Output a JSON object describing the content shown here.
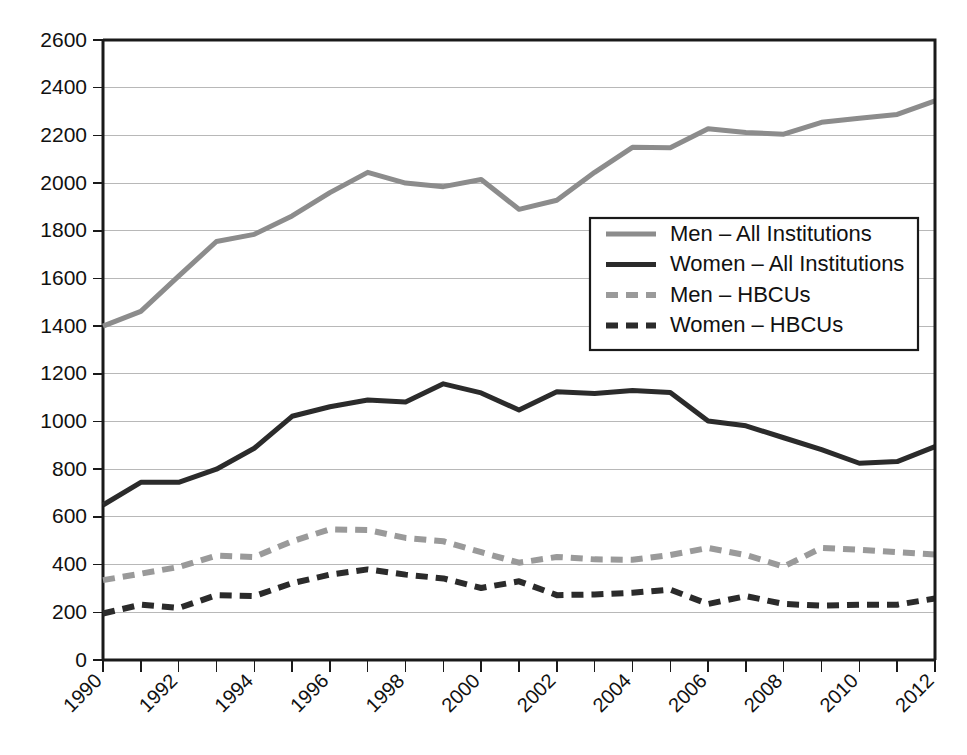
{
  "chart_data": {
    "type": "line",
    "title": "",
    "subtitle": "",
    "xlabel": "",
    "ylabel": "",
    "xlim": [
      1990,
      2012
    ],
    "ylim": [
      0,
      2600
    ],
    "ytick_step": 200,
    "xtick_step": 1,
    "xlabel_step": 2,
    "grid": true,
    "grid_axis": "y",
    "legend_position": "inside-upper-right",
    "x": [
      1990,
      1991,
      1992,
      1993,
      1994,
      1995,
      1996,
      1997,
      1998,
      1999,
      2000,
      2001,
      2002,
      2003,
      2004,
      2005,
      2006,
      2007,
      2008,
      2009,
      2010,
      2011,
      2012
    ],
    "xtick_labels": [
      "1990",
      "1992",
      "1994",
      "1996",
      "1998",
      "2000",
      "2002",
      "2004",
      "2006",
      "2008",
      "2010",
      "2012"
    ],
    "xtick_label_values": [
      1990,
      1992,
      1994,
      1996,
      1998,
      2000,
      2002,
      2004,
      2006,
      2008,
      2010,
      2012
    ],
    "ytick_labels": [
      "0",
      "200",
      "400",
      "600",
      "800",
      "1000",
      "1200",
      "1400",
      "1600",
      "1800",
      "2000",
      "2200",
      "2400",
      "2600"
    ],
    "ytick_values": [
      0,
      200,
      400,
      600,
      800,
      1000,
      1200,
      1400,
      1600,
      1800,
      2000,
      2200,
      2400,
      2600
    ],
    "series": [
      {
        "name": "Men – All Institutions",
        "key": "men-all-institutions",
        "color": "#8c8c8c",
        "dash": "none",
        "width": 5,
        "values": [
          1400,
          1462,
          1610,
          1755,
          1785,
          1862,
          1960,
          2045,
          2000,
          1985,
          2015,
          1890,
          1928,
          2045,
          2150,
          2148,
          2228,
          2212,
          2205,
          2255,
          2272,
          2288,
          2345
        ]
      },
      {
        "name": "Women – All Institutions",
        "key": "women-all-institutions",
        "color": "#2b2b2b",
        "dash": "none",
        "width": 5,
        "values": [
          650,
          745,
          745,
          800,
          888,
          1022,
          1062,
          1090,
          1082,
          1158,
          1120,
          1048,
          1125,
          1118,
          1130,
          1122,
          1002,
          982,
          932,
          882,
          825,
          832,
          895
        ]
      },
      {
        "name": "Men – HBCUs",
        "key": "men-hbcus",
        "color": "#9a9a9a",
        "dash": "12,8",
        "width": 6,
        "values": [
          335,
          362,
          390,
          438,
          432,
          498,
          548,
          545,
          512,
          498,
          452,
          408,
          432,
          422,
          420,
          440,
          470,
          440,
          392,
          470,
          462,
          452,
          442
        ]
      },
      {
        "name": "Women – HBCUs",
        "key": "women-hbcus",
        "color": "#2b2b2b",
        "dash": "12,8",
        "width": 6,
        "values": [
          195,
          232,
          218,
          272,
          268,
          322,
          358,
          380,
          358,
          342,
          302,
          330,
          272,
          275,
          282,
          295,
          235,
          268,
          235,
          228,
          232,
          232,
          258
        ]
      }
    ]
  },
  "legend": {
    "items": [
      {
        "label": "Men – All Institutions"
      },
      {
        "label": "Women – All Institutions"
      },
      {
        "label": "Men – HBCUs"
      },
      {
        "label": "Women – HBCUs"
      }
    ]
  },
  "geometry": {
    "plot_left": 103,
    "plot_right": 935,
    "plot_top": 40,
    "plot_bottom": 660,
    "legend_x": 590,
    "legend_y": 218,
    "legend_w": 328,
    "legend_h": 132
  }
}
